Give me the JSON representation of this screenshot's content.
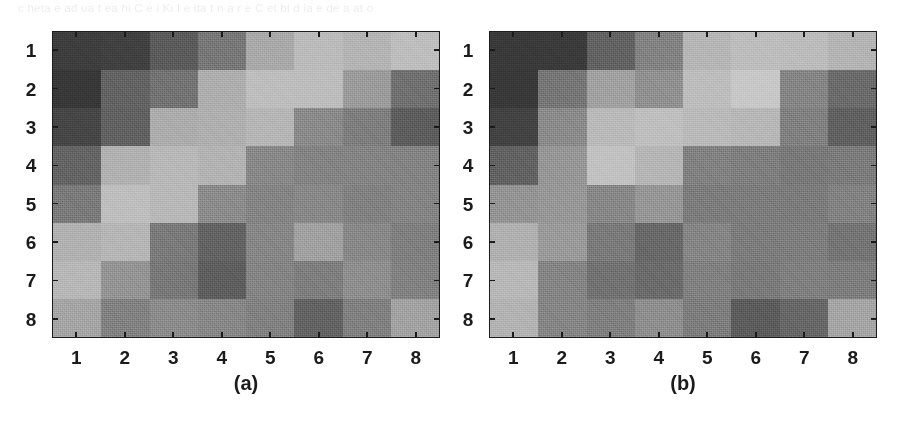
{
  "page": {
    "background_color": "#ffffff",
    "bleed_through_text": "c heta    e ad  ua t ea  hi C  e  i  Ki    I e      ita  t  n  a  r   e   C  et    bl  d  ia  e  de  a   at  o",
    "bleed_through_color": "#ededed"
  },
  "figure": {
    "type": "two-panel grayscale heatmap (8x8 matrices)",
    "axis_color": "#1b1b1b",
    "panels": [
      {
        "id": "a",
        "caption": "(a)",
        "x_tick_labels": [
          "1",
          "2",
          "3",
          "4",
          "5",
          "6",
          "7",
          "8"
        ],
        "y_tick_labels": [
          "1",
          "2",
          "3",
          "4",
          "5",
          "6",
          "7",
          "8"
        ]
      },
      {
        "id": "b",
        "caption": "(b)",
        "x_tick_labels": [
          "1",
          "2",
          "3",
          "4",
          "5",
          "6",
          "7",
          "8"
        ],
        "y_tick_labels": [
          "1",
          "2",
          "3",
          "4",
          "5",
          "6",
          "7",
          "8"
        ]
      }
    ]
  },
  "chart_data": [
    {
      "type": "heatmap",
      "title": "(a)",
      "xlabel": "",
      "ylabel": "",
      "xticks": [
        "1",
        "2",
        "3",
        "4",
        "5",
        "6",
        "7",
        "8"
      ],
      "yticks": [
        "1",
        "2",
        "3",
        "4",
        "5",
        "6",
        "7",
        "8"
      ],
      "grid": false,
      "colormap": "gray",
      "value_range": [
        0,
        255
      ],
      "note": "values are 8-bit grayscale intensities read off the scanned image; low = dark, high = light",
      "values": [
        [
          62,
          62,
          88,
          116,
          168,
          186,
          176,
          190
        ],
        [
          54,
          96,
          112,
          176,
          186,
          186,
          152,
          112
        ],
        [
          72,
          96,
          170,
          176,
          180,
          136,
          128,
          92
        ],
        [
          96,
          176,
          182,
          180,
          138,
          132,
          130,
          132
        ],
        [
          124,
          186,
          182,
          136,
          130,
          132,
          128,
          132
        ],
        [
          176,
          184,
          120,
          100,
          136,
          158,
          136,
          128
        ],
        [
          180,
          148,
          122,
          92,
          132,
          126,
          138,
          126
        ],
        [
          162,
          126,
          138,
          136,
          126,
          96,
          124,
          160
        ]
      ]
    },
    {
      "type": "heatmap",
      "title": "(b)",
      "xlabel": "",
      "ylabel": "",
      "xticks": [
        "1",
        "2",
        "3",
        "4",
        "5",
        "6",
        "7",
        "8"
      ],
      "yticks": [
        "1",
        "2",
        "3",
        "4",
        "5",
        "6",
        "7",
        "8"
      ],
      "grid": false,
      "colormap": "gray",
      "value_range": [
        0,
        255
      ],
      "note": "values are 8-bit grayscale intensities read off the scanned image; low = dark, high = light",
      "values": [
        [
          58,
          58,
          96,
          130,
          184,
          188,
          186,
          176
        ],
        [
          54,
          118,
          160,
          140,
          188,
          196,
          134,
          104
        ],
        [
          66,
          134,
          186,
          188,
          188,
          182,
          128,
          92
        ],
        [
          96,
          150,
          196,
          184,
          130,
          124,
          122,
          120
        ],
        [
          146,
          152,
          134,
          146,
          126,
          124,
          124,
          126
        ],
        [
          178,
          150,
          118,
          104,
          132,
          126,
          124,
          112
        ],
        [
          180,
          132,
          116,
          104,
          130,
          124,
          126,
          124
        ],
        [
          176,
          134,
          128,
          144,
          126,
          88,
          100,
          162
        ]
      ]
    }
  ]
}
